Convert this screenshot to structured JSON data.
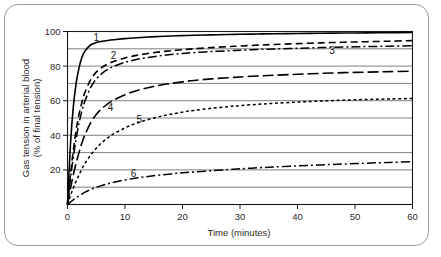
{
  "chart_data": {
    "type": "line",
    "title": "",
    "xlabel": "Time (minutes)",
    "ylabel": "Gas tension in arterial blood (% of final tension)",
    "ylabel_line1": "Gas tension in arterial blood",
    "ylabel_line2": "(% of final tension)",
    "xlim": [
      0,
      60
    ],
    "ylim": [
      0,
      100
    ],
    "xticks": [
      0,
      10,
      20,
      30,
      40,
      50,
      60
    ],
    "xtick_labels": [
      "0",
      "10",
      "20",
      "30",
      "40",
      "50",
      "60"
    ],
    "yticks": [
      20,
      40,
      60,
      80,
      100
    ],
    "ytick_labels": [
      "20",
      "40",
      "60",
      "80",
      "100"
    ],
    "gridlines_y": [
      10,
      20,
      30,
      40,
      50,
      60,
      70,
      80,
      90
    ],
    "grid": true,
    "grid_axis": "y",
    "legend": "inline-curve-labels",
    "x": [
      0,
      0.5,
      1,
      1.5,
      2,
      2.5,
      3,
      4,
      5,
      6,
      7,
      8,
      10,
      12,
      14,
      16,
      18,
      20,
      22,
      25,
      28,
      30,
      33,
      36,
      40,
      44,
      48,
      52,
      56,
      60
    ],
    "series": [
      {
        "name": "1",
        "label": "1",
        "linestyle": "solid",
        "label_x": 5.0,
        "label_y": 94.5,
        "values": [
          0,
          34,
          56,
          70,
          79,
          85,
          88.5,
          92.2,
          93.6,
          94.3,
          94.8,
          95.2,
          95.9,
          96.4,
          96.8,
          97.1,
          97.4,
          97.6,
          97.8,
          98.05,
          98.25,
          98.4,
          98.55,
          98.7,
          98.85,
          99.0,
          99.1,
          99.2,
          99.3,
          99.4
        ]
      },
      {
        "name": "2",
        "label": "2",
        "linestyle": "dashed",
        "label_x": 8.0,
        "label_y": 84.0,
        "values": [
          0,
          17,
          31,
          43,
          52,
          59,
          64.5,
          72,
          76.5,
          79.3,
          81.2,
          82.6,
          84.7,
          86.2,
          87.3,
          88.2,
          88.9,
          89.5,
          90.0,
          90.7,
          91.3,
          91.6,
          92.1,
          92.5,
          93.0,
          93.4,
          93.8,
          94.1,
          94.4,
          94.7
        ]
      },
      {
        "name": "3",
        "label": "3",
        "linestyle": "dashdot",
        "label_x": 46.0,
        "label_y": 87.0,
        "values": [
          0,
          15,
          27,
          38,
          47,
          54,
          59.5,
          67.5,
          72.5,
          75.8,
          78.1,
          79.8,
          82.2,
          83.8,
          85.0,
          85.9,
          86.7,
          87.3,
          87.8,
          88.4,
          88.9,
          89.2,
          89.6,
          89.9,
          90.3,
          90.7,
          91.0,
          91.3,
          91.5,
          91.8
        ]
      },
      {
        "name": "4",
        "label": "4",
        "linestyle": "longdash",
        "label_x": 7.5,
        "label_y": 54.0,
        "values": [
          0,
          9,
          17,
          24,
          30,
          35.5,
          40,
          47,
          52,
          55.5,
          58.2,
          60.3,
          63.5,
          65.8,
          67.5,
          68.9,
          70.0,
          70.9,
          71.7,
          72.6,
          73.3,
          73.7,
          74.3,
          74.7,
          75.3,
          75.8,
          76.2,
          76.5,
          76.8,
          77.1
        ]
      },
      {
        "name": "5",
        "label": "5",
        "linestyle": "dotted",
        "label_x": 12.5,
        "label_y": 47.0,
        "values": [
          0,
          5,
          9.5,
          13.5,
          17,
          20.5,
          23.5,
          28.5,
          32.5,
          35.8,
          38.5,
          40.8,
          44.3,
          47.0,
          49.1,
          50.8,
          52.2,
          53.4,
          54.4,
          55.6,
          56.6,
          57.2,
          57.9,
          58.5,
          59.2,
          59.8,
          60.3,
          60.7,
          61.0,
          61.3
        ]
      },
      {
        "name": "6",
        "label": "6",
        "linestyle": "dashdot",
        "label_x": 11.5,
        "label_y": 16.0,
        "values": [
          0,
          1.4,
          2.7,
          3.9,
          5.0,
          6.0,
          7.0,
          8.6,
          9.9,
          11.0,
          12.0,
          12.8,
          14.2,
          15.3,
          16.2,
          17.0,
          17.7,
          18.3,
          18.8,
          19.5,
          20.2,
          20.6,
          21.2,
          21.7,
          22.3,
          22.9,
          23.4,
          23.9,
          24.3,
          24.7
        ]
      }
    ]
  },
  "colors": {
    "curve": "#000000",
    "grid": "#4a4a4a",
    "frame": "#1a1a1a",
    "border": "#9a9a9a",
    "background": "#ffffff",
    "text": "#2b2b2b"
  }
}
